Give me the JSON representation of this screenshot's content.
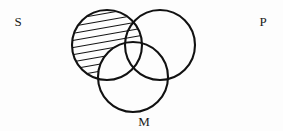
{
  "figure": {
    "kind": "syllogistic-venn-diagram",
    "background_color": "#fdfdfd",
    "stroke_color": "#111111",
    "hatch_color": "#111111",
    "width": 283,
    "height": 131
  },
  "labels": {
    "subject": "S",
    "predicate": "P",
    "middle": "M"
  },
  "label_positions": {
    "subject": {
      "x": 18,
      "y": 26
    },
    "predicate": {
      "x": 263,
      "y": 26
    },
    "middle": {
      "x": 144,
      "y": 126
    }
  },
  "circles": [
    {
      "id": "S",
      "label": "S",
      "cx": 107,
      "cy": 45,
      "r": 35,
      "stroke_width": 2.1
    },
    {
      "id": "P",
      "label": "P",
      "cx": 160,
      "cy": 45,
      "r": 35,
      "stroke_width": 2.1
    },
    {
      "id": "M",
      "label": "M",
      "cx": 133,
      "cy": 77,
      "r": 35,
      "stroke_width": 2.1
    }
  ],
  "shading": {
    "region_id": "S-minus-M",
    "description": "S circle shaded excluding the portion inside M",
    "style": "diagonal-hatch",
    "angle_degrees": 10,
    "line_spacing": 7,
    "line_width": 1.6,
    "line_count": 10
  }
}
